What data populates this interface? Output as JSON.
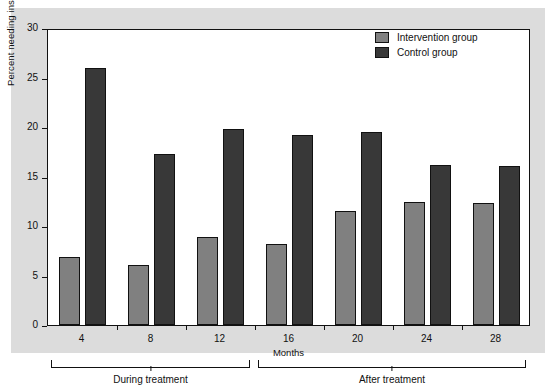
{
  "chart_data": {
    "type": "bar",
    "title": "",
    "xlabel": "Months",
    "ylabel": "Percent needing institutional care",
    "categories": [
      "4",
      "8",
      "12",
      "16",
      "20",
      "24",
      "28"
    ],
    "ylim": [
      0,
      30
    ],
    "yticks": [
      "0",
      "5",
      "10",
      "15",
      "20",
      "25",
      "30"
    ],
    "grid": false,
    "legend_position": "top-right",
    "series": [
      {
        "name": "Intervention group",
        "color": "#808080",
        "values": [
          6.9,
          6.1,
          8.9,
          8.2,
          11.5,
          12.4,
          12.3
        ]
      },
      {
        "name": "Control group",
        "color": "#383838",
        "values": [
          26.0,
          17.3,
          19.8,
          19.2,
          19.5,
          16.2,
          16.1
        ]
      }
    ],
    "annotations": [
      {
        "label": "During treatment",
        "spans": [
          "4",
          "8",
          "12"
        ]
      },
      {
        "label": "After treatment",
        "spans": [
          "16",
          "20",
          "24",
          "28"
        ]
      }
    ]
  },
  "legend": {
    "items": [
      {
        "label": "Intervention group"
      },
      {
        "label": "Control group"
      }
    ]
  },
  "colors": {
    "figure_background": "#dcdcdc",
    "plot_background": "#ffffff",
    "axis": "#111111",
    "intervention": "#808080",
    "control": "#383838"
  }
}
